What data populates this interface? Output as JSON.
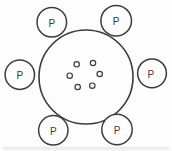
{
  "diagram": {
    "background_color": "#fdfdfd",
    "line_color": "#3c3c3c",
    "central_circle": {
      "fill": "none",
      "inner_dots_count": 6,
      "inner_dots_shape": "small-hollow-circle"
    },
    "satellites": [
      {
        "label": "P",
        "position": "top-left"
      },
      {
        "label": "P",
        "position": "top-right"
      },
      {
        "label": "P",
        "position": "right"
      },
      {
        "label": "P",
        "position": "left"
      },
      {
        "label": "P",
        "position": "bottom-left"
      },
      {
        "label": "P",
        "position": "bottom-right"
      }
    ],
    "artifact": {
      "type": "faint-scan-line",
      "color": "#c9c9c9"
    }
  }
}
